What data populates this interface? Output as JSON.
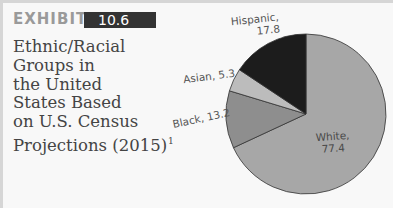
{
  "exhibit": {
    "label": "EXHIBIT",
    "number": "10.6"
  },
  "title": {
    "lines": [
      "Ethnic/Racial",
      "Groups in",
      "the United",
      "States Based",
      "on U.S. Census",
      "Projections (2015)"
    ],
    "footnote": "1"
  },
  "colors": {
    "white": "#a7a7a7",
    "black": "#8e8e8e",
    "asian": "#bcbcbc",
    "hispanic": "#1c1c1c",
    "background": "#f8f8f8",
    "badge": "#333333"
  },
  "labels": {
    "hispanic_name": "Hispanic,",
    "hispanic_value": "17.8",
    "asian": "Asian, 5.3",
    "black": "Black, 13.2",
    "white_name": "White,",
    "white_value": "77.4"
  },
  "chart_data": {
    "type": "pie",
    "title": "Ethnic/Racial Groups in the United States Based on U.S. Census Projections (2015)",
    "categories": [
      "White",
      "Black",
      "Asian",
      "Hispanic"
    ],
    "values": [
      77.4,
      13.2,
      5.3,
      17.8
    ],
    "start_angle": "12 o'clock",
    "direction": "clockwise",
    "legend": "none (direct labels)",
    "annotations": [
      "White, 77.4",
      "Black, 13.2",
      "Asian, 5.3",
      "Hispanic, 17.8"
    ]
  }
}
